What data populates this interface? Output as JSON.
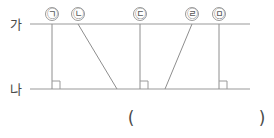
{
  "figure": {
    "type": "geometry-parallel-lines",
    "lines": [
      {
        "id": "top",
        "label": "가",
        "y": 24,
        "x1": 30,
        "x2": 250,
        "label_x": 10,
        "label_y": 29
      },
      {
        "id": "bottom",
        "label": "나",
        "y": 89,
        "x1": 30,
        "x2": 250,
        "label_x": 10,
        "label_y": 94
      }
    ],
    "points": [
      {
        "id": "a",
        "label": "㉠",
        "cx": 52,
        "cy": 14,
        "r": 6.5
      },
      {
        "id": "b",
        "label": "㉡",
        "cx": 78,
        "cy": 14,
        "r": 6.5
      },
      {
        "id": "c",
        "label": "㉢",
        "cx": 140,
        "cy": 14,
        "r": 6.5
      },
      {
        "id": "d",
        "label": "㉣",
        "cx": 192,
        "cy": 14,
        "r": 6.5
      },
      {
        "id": "e",
        "label": "㉤",
        "cx": 219,
        "cy": 14,
        "r": 6.5
      }
    ],
    "segments": [
      {
        "id": "seg-a",
        "point": "㉠",
        "x1": 52,
        "y1": 24,
        "x2": 52,
        "y2": 89,
        "perpendicular": true
      },
      {
        "id": "seg-b",
        "point": "㉡",
        "x1": 78,
        "y1": 24,
        "x2": 117,
        "y2": 89,
        "perpendicular": false
      },
      {
        "id": "seg-c",
        "point": "㉢",
        "x1": 140,
        "y1": 24,
        "x2": 140,
        "y2": 89,
        "perpendicular": true
      },
      {
        "id": "seg-d",
        "point": "㉣",
        "x1": 192,
        "y1": 24,
        "x2": 165,
        "y2": 89,
        "perpendicular": false
      },
      {
        "id": "seg-e",
        "point": "㉤",
        "x1": 219,
        "y1": 24,
        "x2": 219,
        "y2": 89,
        "perpendicular": true
      }
    ],
    "right_angle_marks": [
      {
        "id": "mark-a",
        "x": 52,
        "y": 89,
        "size": 8
      },
      {
        "id": "mark-c",
        "x": 140,
        "y": 89,
        "size": 8
      },
      {
        "id": "mark-e",
        "x": 219,
        "y": 89,
        "size": 8
      }
    ],
    "answer_field": {
      "open_paren": "(",
      "close_paren": ")",
      "value": "",
      "open_x": 131,
      "close_x": 262,
      "y": 124
    }
  }
}
